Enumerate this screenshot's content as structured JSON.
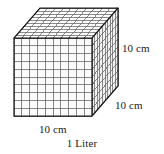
{
  "figure": {
    "name": "base-ten-thousand-cube",
    "caption": "1 Liter",
    "labels": {
      "height": "10 cm",
      "depth": "10 cm",
      "width": "10 cm"
    },
    "geometry": {
      "divisions": 10,
      "front_left_x": 14,
      "front_top_y": 38,
      "front_size": 78,
      "depth_dx": 26,
      "depth_dy": -30
    },
    "colors": {
      "line": "#1a1a1a",
      "minor_line": "#595959",
      "face_front": "#fbfbfb",
      "face_top": "#ffffff",
      "face_right": "#f2f2f2",
      "text": "#1a1a1a",
      "background": "#ffffff"
    }
  }
}
